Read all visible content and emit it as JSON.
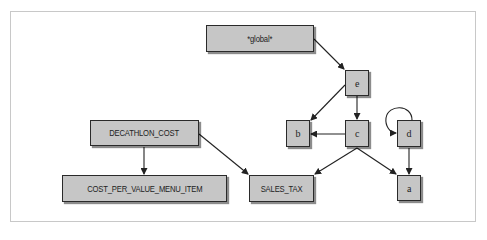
{
  "diagram": {
    "nodes": {
      "global": {
        "label": "*global*",
        "x": 206,
        "y": 25,
        "w": 108,
        "h": 27
      },
      "e": {
        "label": "e",
        "x": 345,
        "y": 70,
        "w": 24,
        "h": 26
      },
      "b": {
        "label": "b",
        "x": 286,
        "y": 120,
        "w": 24,
        "h": 27
      },
      "c": {
        "label": "c",
        "x": 345,
        "y": 120,
        "w": 24,
        "h": 27
      },
      "d": {
        "label": "d",
        "x": 397,
        "y": 120,
        "w": 24,
        "h": 27
      },
      "a": {
        "label": "a",
        "x": 397,
        "y": 175,
        "w": 24,
        "h": 26
      },
      "decathlon_cost": {
        "label": "DECATHLON_COST",
        "x": 90,
        "y": 120,
        "w": 109,
        "h": 26
      },
      "cost_per_value_menu_item": {
        "label": "COST_PER_VALUE_MENU_ITEM",
        "x": 62,
        "y": 175,
        "w": 165,
        "h": 27
      },
      "sales_tax": {
        "label": "SALES_TAX",
        "x": 249,
        "y": 175,
        "w": 65,
        "h": 27
      }
    },
    "edges": [
      {
        "from": "*global*",
        "to": "e"
      },
      {
        "from": "e",
        "to": "b"
      },
      {
        "from": "e",
        "to": "c"
      },
      {
        "from": "c",
        "to": "b"
      },
      {
        "from": "c",
        "to": "SALES_TAX"
      },
      {
        "from": "c",
        "to": "a"
      },
      {
        "from": "d",
        "to": "d"
      },
      {
        "from": "d",
        "to": "a"
      },
      {
        "from": "DECATHLON_COST",
        "to": "COST_PER_VALUE_MENU_ITEM"
      },
      {
        "from": "DECATHLON_COST",
        "to": "SALES_TAX"
      }
    ],
    "colors": {
      "node_fill": "#c6c6c6",
      "node_border": "#2a2a2a",
      "edge": "#222222",
      "frame": "#c8c8c8"
    }
  }
}
